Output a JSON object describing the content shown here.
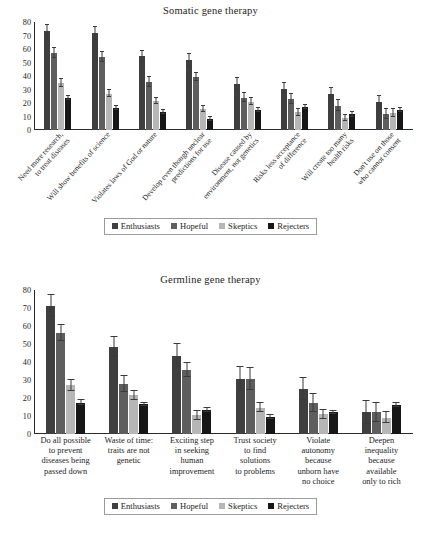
{
  "figure": {
    "background": "#ffffff"
  },
  "series_colors": {
    "Enthusiasts": "#3f3f3f",
    "Hopeful": "#5e5e5e",
    "Skeptics": "#b6b6b6",
    "Rejecters": "#171717"
  },
  "legend": {
    "items": [
      {
        "label": "Enthusiasts",
        "color": "#3f3f3f"
      },
      {
        "label": "Hopeful",
        "color": "#5e5e5e"
      },
      {
        "label": "Skeptics",
        "color": "#b6b6b6"
      },
      {
        "label": "Rejecters",
        "color": "#171717"
      }
    ]
  },
  "chart_data": [
    {
      "type": "bar",
      "id": "somatic",
      "title": "Somatic gene therapy",
      "xlabel": "",
      "ylabel": "",
      "ylim": [
        0,
        80
      ],
      "yticks": [
        0,
        10,
        20,
        30,
        40,
        50,
        60,
        70,
        80
      ],
      "grid": false,
      "legend_position": "bottom",
      "error_bars": "95% CI",
      "categories": [
        "Need more research, to treat diseases",
        "Will show benefits of science",
        "Violates laws of God or nature",
        "Develop even though unclear predictions for use",
        "Disease caused by environment, not genetics",
        "Risks less acceptance of difference",
        "Will create too many health risks",
        "Don't use on those who cannot consent"
      ],
      "categories_lines": [
        [
          "Need more research,",
          "to treat diseases"
        ],
        [
          "Will show benefits of science"
        ],
        [
          "Violates laws of God or nature"
        ],
        [
          "Develop even though unclear",
          "predictions for use"
        ],
        [
          "Disease caused by",
          "environment, not genetics"
        ],
        [
          "Risks less acceptance",
          "of difference"
        ],
        [
          "Will create too many",
          "health risks"
        ],
        [
          "Don't use on those",
          "who cannot consent"
        ]
      ],
      "series": [
        {
          "name": "Enthusiasts",
          "color": "#3f3f3f",
          "values": [
            73,
            71.5,
            54.5,
            51.5,
            34,
            30.5,
            27,
            20.5
          ],
          "err": [
            4.5,
            4.5,
            4.0,
            4.5,
            4.5,
            4.0,
            4.5,
            4.5
          ]
        },
        {
          "name": "Hopeful",
          "color": "#5e5e5e",
          "values": [
            57,
            54,
            35.5,
            39.5,
            24,
            23,
            18,
            12
          ],
          "err": [
            4.0,
            3.5,
            3.5,
            3.0,
            3.5,
            3.5,
            4.0,
            3.5
          ]
        },
        {
          "name": "Skeptics",
          "color": "#b6b6b6",
          "values": [
            35,
            27,
            21.5,
            15.5,
            21,
            13,
            9,
            12.5
          ],
          "err": [
            3.0,
            2.5,
            2.5,
            2.0,
            2.5,
            2.5,
            2.5,
            3.0
          ]
        },
        {
          "name": "Rejecters",
          "color": "#171717",
          "values": [
            23.5,
            16.5,
            13.5,
            8,
            15,
            17,
            11.5,
            14.5
          ],
          "err": [
            1.5,
            1.5,
            1.5,
            1.5,
            1.5,
            1.5,
            1.5,
            1.5
          ]
        }
      ]
    },
    {
      "type": "bar",
      "id": "germline",
      "title": "Germline gene therapy",
      "xlabel": "",
      "ylabel": "",
      "ylim": [
        0,
        80
      ],
      "yticks": [
        0,
        10,
        20,
        30,
        40,
        50,
        60,
        70,
        80
      ],
      "grid": false,
      "legend_position": "bottom",
      "error_bars": "95% CI",
      "categories": [
        "Do all possible to prevent diseases being passed down",
        "Waste of time: traits are not genetic",
        "Exciting step in seeking human improvement",
        "Trust society to find solutions to problems",
        "Violate autonomy because unborn have no choice",
        "Deepen inequality because available only to rich"
      ],
      "categories_lines": [
        [
          "Do all possible",
          "to prevent",
          "diseases being",
          "passed down"
        ],
        [
          "Waste of time:",
          "traits are not",
          "genetic"
        ],
        [
          "Exciting step",
          "in seeking",
          "human",
          "improvement"
        ],
        [
          "Trust society",
          "to find",
          "solutions",
          "to problems"
        ],
        [
          "Violate",
          "autonomy",
          "because",
          "unborn have",
          "no choice"
        ],
        [
          "Deepen",
          "inequality",
          "because",
          "available",
          "only to rich"
        ]
      ],
      "series": [
        {
          "name": "Enthusiasts",
          "color": "#3f3f3f",
          "values": [
            71,
            48.5,
            43.5,
            30.5,
            25,
            12
          ],
          "err": [
            6.0,
            5.5,
            6.5,
            6.5,
            6.0,
            6.5
          ]
        },
        {
          "name": "Hopeful",
          "color": "#5e5e5e",
          "values": [
            56,
            28,
            35.5,
            30.5,
            17,
            12
          ],
          "err": [
            4.5,
            4.5,
            4.0,
            6.0,
            5.0,
            5.5
          ]
        },
        {
          "name": "Skeptics",
          "color": "#b6b6b6",
          "values": [
            27,
            21.5,
            10.5,
            14.5,
            11,
            9
          ],
          "err": [
            3.0,
            2.5,
            2.5,
            2.5,
            2.5,
            3.0
          ]
        },
        {
          "name": "Rejecters",
          "color": "#171717",
          "values": [
            17.5,
            16.5,
            13.5,
            9.5,
            12,
            16
          ],
          "err": [
            1.5,
            1.0,
            1.0,
            1.0,
            1.0,
            1.0
          ]
        }
      ]
    }
  ]
}
